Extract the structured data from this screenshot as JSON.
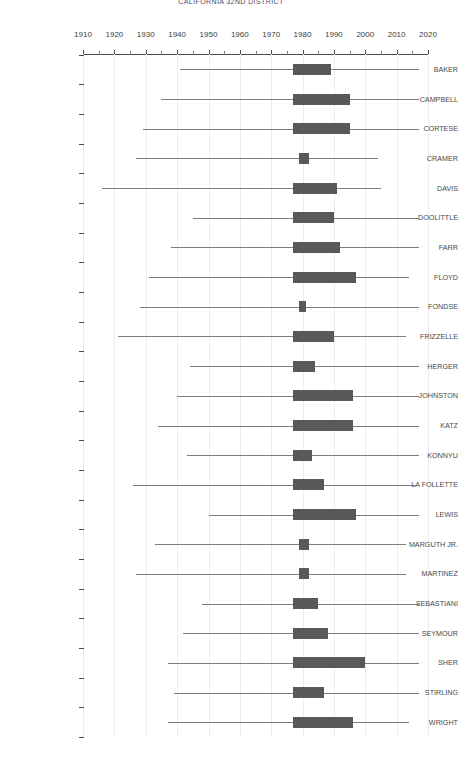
{
  "chart_data": {
    "type": "bar",
    "title": "CALIFORNIA 32ND DISTRICT",
    "xlabel": "",
    "ylabel": "",
    "xlim": [
      1910,
      2020
    ],
    "grid": true,
    "legend": "none",
    "orientation": "horizontal",
    "x_major_step": 10,
    "x_minor_step": 5,
    "bar_color": "#595959",
    "whisker_color": "#7d7d7d",
    "axis_color": "#4a4a4a",
    "grid_color": "#ececf2",
    "xticks": [
      1910,
      1920,
      1930,
      1940,
      1950,
      1960,
      1970,
      1980,
      1990,
      2000,
      2010,
      2020
    ],
    "categories": [
      "BAKER",
      "CAMPBELL",
      "CORTESE",
      "CRAMER",
      "DAVIS",
      "DOOLITTLE",
      "FARR",
      "FLOYD",
      "FONDSE",
      "FRIZZELLE",
      "HERGER",
      "JOHNSTON",
      "KATZ",
      "KONNYU",
      "LA FOLLETTE",
      "LEWIS",
      "MARGUTH JR.",
      "MARTINEZ",
      "SEBASTIANI",
      "SEYMOUR",
      "SHER",
      "STIRLING",
      "WRIGHT"
    ],
    "rows": [
      {
        "name": "BAKER",
        "whisker_low": 1941,
        "box_low": 1977,
        "box_high": 1989,
        "whisker_high": 2017
      },
      {
        "name": "CAMPBELL",
        "whisker_low": 1935,
        "box_low": 1977,
        "box_high": 1995,
        "whisker_high": 2017
      },
      {
        "name": "CORTESE",
        "whisker_low": 1929,
        "box_low": 1977,
        "box_high": 1995,
        "whisker_high": 2017
      },
      {
        "name": "CRAMER",
        "whisker_low": 1927,
        "box_low": 1979,
        "box_high": 1982,
        "whisker_high": 2004
      },
      {
        "name": "DAVIS",
        "whisker_low": 1916,
        "box_low": 1977,
        "box_high": 1991,
        "whisker_high": 2005
      },
      {
        "name": "DOOLITTLE",
        "whisker_low": 1945,
        "box_low": 1977,
        "box_high": 1990,
        "whisker_high": 2017
      },
      {
        "name": "FARR",
        "whisker_low": 1938,
        "box_low": 1977,
        "box_high": 1992,
        "whisker_high": 2017
      },
      {
        "name": "FLOYD",
        "whisker_low": 1931,
        "box_low": 1977,
        "box_high": 1997,
        "whisker_high": 2014
      },
      {
        "name": "FONDSE",
        "whisker_low": 1928,
        "box_low": 1979,
        "box_high": 1981,
        "whisker_high": 2017
      },
      {
        "name": "FRIZZELLE",
        "whisker_low": 1921,
        "box_low": 1977,
        "box_high": 1990,
        "whisker_high": 2013
      },
      {
        "name": "HERGER",
        "whisker_low": 1944,
        "box_low": 1977,
        "box_high": 1984,
        "whisker_high": 2017
      },
      {
        "name": "JOHNSTON",
        "whisker_low": 1940,
        "box_low": 1977,
        "box_high": 1996,
        "whisker_high": 2017
      },
      {
        "name": "KATZ",
        "whisker_low": 1934,
        "box_low": 1977,
        "box_high": 1996,
        "whisker_high": 2017
      },
      {
        "name": "KONNYU",
        "whisker_low": 1943,
        "box_low": 1977,
        "box_high": 1983,
        "whisker_high": 2017
      },
      {
        "name": "LA FOLLETTE",
        "whisker_low": 1926,
        "box_low": 1977,
        "box_high": 1987,
        "whisker_high": 2017
      },
      {
        "name": "LEWIS",
        "whisker_low": 1950,
        "box_low": 1977,
        "box_high": 1997,
        "whisker_high": 2017
      },
      {
        "name": "MARGUTH JR.",
        "whisker_low": 1933,
        "box_low": 1979,
        "box_high": 1982,
        "whisker_high": 2013
      },
      {
        "name": "MARTINEZ",
        "whisker_low": 1927,
        "box_low": 1979,
        "box_high": 1982,
        "whisker_high": 2013
      },
      {
        "name": "SEBASTIANI",
        "whisker_low": 1948,
        "box_low": 1977,
        "box_high": 1985,
        "whisker_high": 2017
      },
      {
        "name": "SEYMOUR",
        "whisker_low": 1942,
        "box_low": 1977,
        "box_high": 1988,
        "whisker_high": 2017
      },
      {
        "name": "SHER",
        "whisker_low": 1937,
        "box_low": 1977,
        "box_high": 2000,
        "whisker_high": 2017
      },
      {
        "name": "STIRLING",
        "whisker_low": 1939,
        "box_low": 1977,
        "box_high": 1987,
        "whisker_high": 2017
      },
      {
        "name": "WRIGHT",
        "whisker_low": 1937,
        "box_low": 1977,
        "box_high": 1996,
        "whisker_high": 2014
      }
    ]
  }
}
